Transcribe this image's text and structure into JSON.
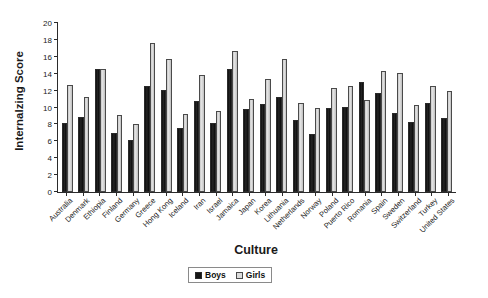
{
  "chart_data": {
    "type": "bar",
    "title": "",
    "xlabel": "Culture",
    "ylabel": "Internalzing Score",
    "ylim": [
      0,
      20
    ],
    "yticks": [
      0,
      2,
      4,
      6,
      8,
      10,
      12,
      14,
      16,
      18,
      20
    ],
    "grid": false,
    "legend_position": "bottom-center",
    "categories": [
      "Australia",
      "Denmark",
      "Ethiopia",
      "Finland",
      "Germany",
      "Greece",
      "Hong Kong",
      "Iceland",
      "Iran",
      "Israel",
      "Jamaica",
      "Japan",
      "Korea",
      "Lithuania",
      "Netherlands",
      "Norway",
      "Poland",
      "Puerto Rico",
      "Romania",
      "Spain",
      "Sweden",
      "Switzerland",
      "Turkey",
      "United States"
    ],
    "series": [
      {
        "name": "Boys",
        "color": "#151515",
        "values": [
          8.2,
          8.9,
          14.6,
          7.0,
          6.2,
          12.6,
          12.1,
          7.6,
          10.8,
          8.2,
          14.5,
          9.8,
          10.4,
          11.3,
          8.5,
          6.9,
          10.0,
          10.1,
          13.0,
          11.7,
          9.3,
          8.3,
          10.5,
          8.8
        ]
      },
      {
        "name": "Girls",
        "color": "#d2d2d2",
        "values": [
          12.7,
          11.3,
          14.5,
          9.1,
          8.1,
          17.6,
          15.7,
          9.2,
          13.8,
          9.6,
          16.7,
          11.0,
          13.4,
          15.8,
          10.5,
          9.9,
          12.3,
          12.5,
          10.9,
          14.3,
          14.1,
          10.3,
          12.5,
          11.9
        ]
      }
    ]
  },
  "axis": {
    "y_title": "Internalzing Score",
    "x_title": "Culture"
  },
  "legend": {
    "items": [
      {
        "label": "Boys",
        "swatch": "boys-swatch"
      },
      {
        "label": "Girls",
        "swatch": "girls-swatch"
      }
    ]
  }
}
